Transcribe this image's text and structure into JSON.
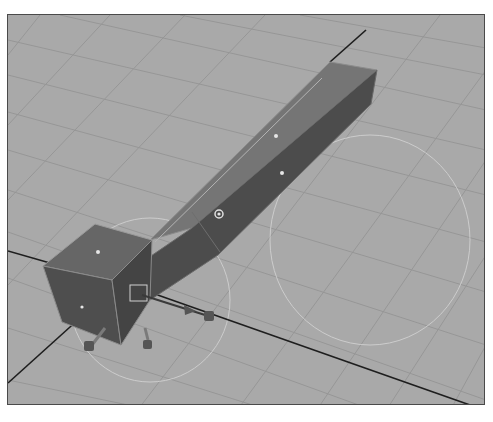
{
  "viewport": {
    "label": "3D perspective viewport",
    "background_color": "#a9a9a9",
    "grid_color": "#949494",
    "axis_color": "#1e1e1e",
    "manipulator_ring_color": "#d4d4d4"
  },
  "scene": {
    "objects": [
      {
        "name": "extruded-bar",
        "type": "polygon-mesh",
        "top_face_color": "#727272",
        "side_face_color": "#4c4c4c",
        "selected": true
      },
      {
        "name": "end-cube",
        "type": "polygon-mesh",
        "top_face_color": "#6a6a6a",
        "side_face_color": "#4a4a4a"
      }
    ],
    "component_markers": 5,
    "manipulator": {
      "type": "move-rotate",
      "pivot_marker": "square"
    }
  }
}
